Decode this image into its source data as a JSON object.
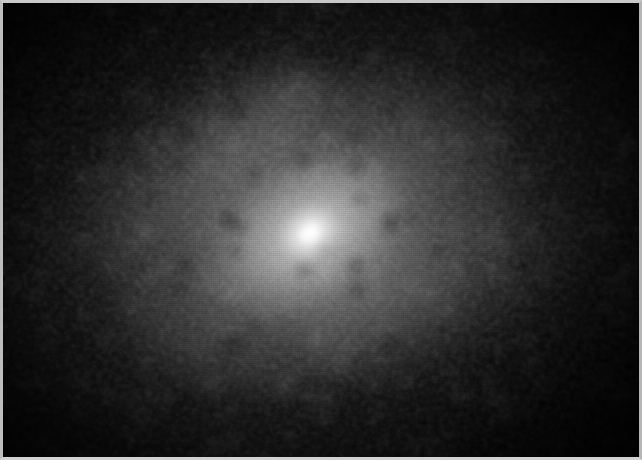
{
  "image": {
    "title": "Monochrome astronomical plate: diffuse nebular / cometary object",
    "medium": "grayscale photographic field",
    "background_color": "#030303",
    "border_color": "#c6c6c6",
    "border_width_px": "3",
    "width_px": "642",
    "height_px": "460"
  },
  "object": {
    "name": "central-bright-nucleus",
    "core_color": "#ffffff",
    "core_x_px": "307",
    "core_y_px": "230",
    "core_width_px": "26",
    "core_height_px": "20",
    "halo_name": "diffuse-coma-halo",
    "halo_color": "#b4b4b4",
    "halo_position_angle_deg": "-30",
    "halo_major_axis_px": "430",
    "halo_minor_axis_px": "300"
  },
  "structures": {
    "outer_coma": {
      "name": "outer-coma",
      "color": "#5a5a5a",
      "major_axis_px": "780",
      "minor_axis_px": "520",
      "angle_deg": "-24"
    },
    "mid_coma": {
      "name": "mid-coma",
      "color": "#8c8c8c",
      "major_axis_px": "430",
      "minor_axis_px": "300",
      "angle_deg": "-28"
    },
    "inner_coma": {
      "name": "inner-coma",
      "color": "#d4d4d4",
      "major_axis_px": "200",
      "minor_axis_px": "140",
      "angle_deg": "-30"
    },
    "extension_upper_left": {
      "name": "upper-left-extension",
      "color": "#787878",
      "angle_deg": "-34"
    },
    "extension_lower_right": {
      "name": "lower-right-extension",
      "color": "#6e6e6e",
      "angle_deg": "-22"
    }
  },
  "texture": {
    "grain_name": "photographic-film-grain",
    "mottling_name": "speckle-mottling",
    "raster_name": "scan-raster-lines",
    "vignette_name": "corner-vignette"
  }
}
